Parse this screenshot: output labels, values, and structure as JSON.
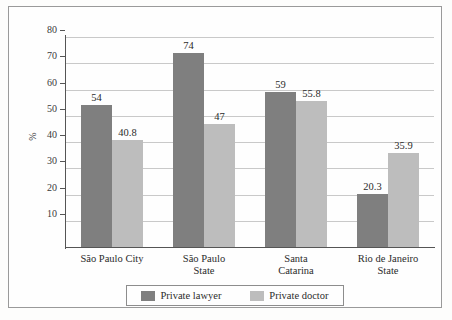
{
  "chart_data": {
    "type": "bar",
    "title": "",
    "xlabel": "",
    "ylabel": "%",
    "ylim": [
      0,
      80
    ],
    "yticks": [
      10,
      20,
      30,
      40,
      50,
      60,
      70,
      80
    ],
    "grid": true,
    "legend_position": "bottom",
    "categories": [
      "São Paulo City",
      "São Paulo\nState",
      "Santa\nCatarina",
      "Rio de Janeiro\nState"
    ],
    "category_lines": [
      [
        "São Paulo City",
        ""
      ],
      [
        "São Paulo",
        "State"
      ],
      [
        "Santa",
        "Catarina"
      ],
      [
        "Rio de Janeiro",
        "State"
      ]
    ],
    "series": [
      {
        "name": "Private lawyer",
        "color": "#7f7f7f",
        "values": [
          54,
          74,
          59,
          20.3
        ],
        "labels": [
          "54",
          "74",
          "59",
          "20.3"
        ]
      },
      {
        "name": "Private doctor",
        "color": "#bdbdbd",
        "values": [
          40.8,
          47,
          55.8,
          35.9
        ],
        "labels": [
          "40.8",
          "47",
          "55.8",
          "35.9"
        ]
      }
    ]
  },
  "axis": {
    "y_tick_labels": [
      "80",
      "70",
      "60",
      "50",
      "40",
      "30",
      "20",
      "10"
    ],
    "y_axis_title": "%"
  },
  "legend": {
    "entries": [
      {
        "label": "Private lawyer",
        "swatch": "dark-gray-swatch"
      },
      {
        "label": "Private doctor",
        "swatch": "light-gray-swatch"
      }
    ]
  }
}
